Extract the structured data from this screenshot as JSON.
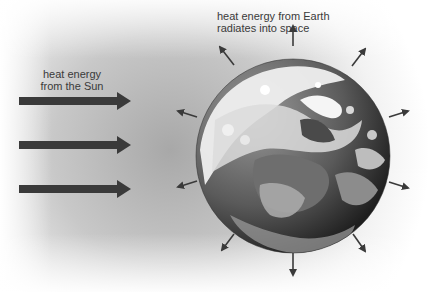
{
  "diagram": {
    "labels": {
      "sun_line1": "heat energy",
      "sun_line2": "from the Sun",
      "earth_line1": "heat energy from Earth",
      "earth_line2": "radiates into space"
    },
    "incoming_arrows": [
      {
        "y": 101
      },
      {
        "y": 145
      },
      {
        "y": 189
      }
    ],
    "outgoing_arrows": [
      "up",
      "up-left",
      "up-right",
      "right-upper",
      "right-lower",
      "down-right",
      "down",
      "down-left",
      "left-lower",
      "left-upper"
    ],
    "colors": {
      "arrow": "#3a3a3a",
      "glow": "#9a9a9a",
      "background": "#ffffff",
      "text": "#3a3a3a"
    }
  }
}
